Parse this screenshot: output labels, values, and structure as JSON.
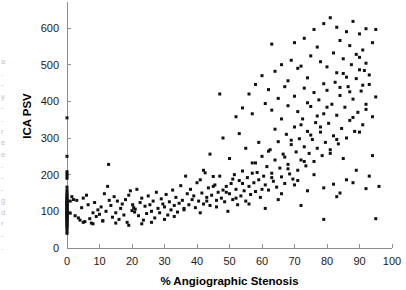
{
  "figure": {
    "kind": "scatter-plot",
    "background_color": "#ffffff",
    "point_color": "#111111",
    "axis_color": "#8d8d8d",
    "edge_marginalia": "a\n.\n-\ny\n-\n.\nr\ne\ne\n.\n-\n-\ng\nd\nr\n-\n."
  },
  "chart_data": {
    "type": "scatter",
    "title": "",
    "xlabel": "% Angiographic Stenosis",
    "ylabel": "ICA PSV",
    "xlim": [
      0,
      100
    ],
    "ylim": [
      0,
      650
    ],
    "xticks": [
      0,
      10,
      20,
      30,
      40,
      50,
      60,
      70,
      80,
      90,
      100
    ],
    "yticks": [
      0,
      100,
      200,
      300,
      400,
      500,
      600
    ],
    "xticklabels": [
      "0",
      "10",
      "20",
      "30",
      "40",
      "50",
      "60",
      "70",
      "80",
      "90",
      "100"
    ],
    "yticklabels": [
      "0",
      "100",
      "200",
      "300",
      "400",
      "500",
      "600"
    ],
    "grid": false,
    "legend": null,
    "marker": "filled-square",
    "marker_size_px": 3,
    "n_points": 286,
    "points": [
      [
        0,
        40
      ],
      [
        0,
        46
      ],
      [
        0,
        52
      ],
      [
        0,
        57
      ],
      [
        0,
        60
      ],
      [
        0,
        63
      ],
      [
        0,
        66
      ],
      [
        0,
        69
      ],
      [
        0,
        72
      ],
      [
        0,
        75
      ],
      [
        0,
        78
      ],
      [
        0,
        80
      ],
      [
        0,
        82
      ],
      [
        0,
        84
      ],
      [
        0,
        86
      ],
      [
        0,
        88
      ],
      [
        0,
        90
      ],
      [
        0,
        92
      ],
      [
        0,
        94
      ],
      [
        0,
        96
      ],
      [
        0,
        98
      ],
      [
        0,
        100
      ],
      [
        0,
        102
      ],
      [
        0,
        104
      ],
      [
        0,
        106
      ],
      [
        0,
        108
      ],
      [
        0,
        110
      ],
      [
        0,
        112
      ],
      [
        0,
        114
      ],
      [
        0,
        116
      ],
      [
        0,
        118
      ],
      [
        0,
        120
      ],
      [
        0,
        122
      ],
      [
        0,
        124
      ],
      [
        0,
        126
      ],
      [
        0,
        128
      ],
      [
        0,
        130
      ],
      [
        0,
        133
      ],
      [
        0,
        136
      ],
      [
        0,
        139
      ],
      [
        0,
        143
      ],
      [
        0,
        147
      ],
      [
        0,
        152
      ],
      [
        0,
        158
      ],
      [
        0,
        166
      ],
      [
        0,
        190
      ],
      [
        0,
        196
      ],
      [
        0,
        202
      ],
      [
        0,
        208
      ],
      [
        0,
        250
      ],
      [
        0,
        355
      ],
      [
        1,
        95
      ],
      [
        1,
        128
      ],
      [
        1.5,
        140
      ],
      [
        2,
        132
      ],
      [
        2.5,
        88
      ],
      [
        3,
        130
      ],
      [
        3.5,
        82
      ],
      [
        4,
        76
      ],
      [
        4.5,
        110
      ],
      [
        5,
        136
      ],
      [
        5.5,
        72
      ],
      [
        6,
        144
      ],
      [
        6.5,
        118
      ],
      [
        7,
        80
      ],
      [
        7.5,
        68
      ],
      [
        8,
        96
      ],
      [
        8.5,
        124
      ],
      [
        9,
        86
      ],
      [
        9.5,
        104
      ],
      [
        10,
        92
      ],
      [
        10.5,
        112
      ],
      [
        11,
        74
      ],
      [
        11.5,
        148
      ],
      [
        12,
        100
      ],
      [
        12.5,
        168
      ],
      [
        12.8,
        228
      ],
      [
        13,
        130
      ],
      [
        13.5,
        116
      ],
      [
        14,
        84
      ],
      [
        14.5,
        140
      ],
      [
        15,
        96
      ],
      [
        15.5,
        128
      ],
      [
        16,
        78
      ],
      [
        16.5,
        108
      ],
      [
        17,
        120
      ],
      [
        17.5,
        90
      ],
      [
        18,
        132
      ],
      [
        18.5,
        70
      ],
      [
        19,
        144
      ],
      [
        19.5,
        156
      ],
      [
        20,
        102
      ],
      [
        20.2,
        118
      ],
      [
        20.5,
        110
      ],
      [
        20.8,
        98
      ],
      [
        21,
        106
      ],
      [
        21.5,
        160
      ],
      [
        22,
        88
      ],
      [
        22.5,
        124
      ],
      [
        23,
        136
      ],
      [
        23.5,
        76
      ],
      [
        24,
        114
      ],
      [
        24.5,
        94
      ],
      [
        25,
        142
      ],
      [
        25.5,
        118
      ],
      [
        26,
        100
      ],
      [
        26.5,
        128
      ],
      [
        27,
        82
      ],
      [
        27.5,
        152
      ],
      [
        28,
        108
      ],
      [
        28.5,
        96
      ],
      [
        29,
        134
      ],
      [
        29.5,
        120
      ],
      [
        30,
        112
      ],
      [
        30.5,
        146
      ],
      [
        31,
        90
      ],
      [
        31.5,
        126
      ],
      [
        32,
        104
      ],
      [
        32.5,
        158
      ],
      [
        33,
        116
      ],
      [
        33.5,
        138
      ],
      [
        34,
        98
      ],
      [
        34.5,
        122
      ],
      [
        35,
        170
      ],
      [
        35.5,
        130
      ],
      [
        36,
        108
      ],
      [
        36.5,
        196
      ],
      [
        37,
        148
      ],
      [
        37.5,
        118
      ],
      [
        38,
        160
      ],
      [
        38.5,
        132
      ],
      [
        39,
        142
      ],
      [
        39.5,
        110
      ],
      [
        40,
        178
      ],
      [
        40.5,
        128
      ],
      [
        41,
        186
      ],
      [
        41.5,
        150
      ],
      [
        42,
        120
      ],
      [
        42.5,
        205
      ],
      [
        43,
        138
      ],
      [
        43.5,
        164
      ],
      [
        44,
        116
      ],
      [
        44.5,
        144
      ],
      [
        45,
        195
      ],
      [
        45.5,
        172
      ],
      [
        46,
        130
      ],
      [
        46.5,
        152
      ],
      [
        47,
        420
      ],
      [
        47.5,
        136
      ],
      [
        48,
        158
      ],
      [
        48.5,
        126
      ],
      [
        49,
        168
      ],
      [
        49.5,
        100
      ],
      [
        50,
        148
      ],
      [
        50.5,
        176
      ],
      [
        51,
        132
      ],
      [
        51.5,
        200
      ],
      [
        52,
        160
      ],
      [
        52.5,
        118
      ],
      [
        53,
        184
      ],
      [
        53.5,
        142
      ],
      [
        54,
        210
      ],
      [
        54.5,
        156
      ],
      [
        55,
        128
      ],
      [
        55.5,
        192
      ],
      [
        56,
        168
      ],
      [
        56.5,
        146
      ],
      [
        57,
        232
      ],
      [
        57.5,
        178
      ],
      [
        58,
        154
      ],
      [
        58.5,
        206
      ],
      [
        59,
        186
      ],
      [
        59.5,
        138
      ],
      [
        60,
        250
      ],
      [
        60.5,
        196
      ],
      [
        61,
        172
      ],
      [
        61.5,
        222
      ],
      [
        62,
        158
      ],
      [
        62.5,
        268
      ],
      [
        63,
        204
      ],
      [
        63.5,
        182
      ],
      [
        64,
        240
      ],
      [
        64.5,
        166
      ],
      [
        65,
        290
      ],
      [
        65.5,
        218
      ],
      [
        66,
        194
      ],
      [
        66.5,
        256
      ],
      [
        67,
        176
      ],
      [
        67.5,
        310
      ],
      [
        68,
        228
      ],
      [
        68.5,
        202
      ],
      [
        69,
        282
      ],
      [
        69.5,
        188
      ],
      [
        70,
        330
      ],
      [
        70.5,
        262
      ],
      [
        71,
        212
      ],
      [
        71.5,
        298
      ],
      [
        72,
        240
      ],
      [
        72.5,
        352
      ],
      [
        73,
        276
      ],
      [
        73.5,
        224
      ],
      [
        74,
        318
      ],
      [
        74.5,
        258
      ],
      [
        75,
        386
      ],
      [
        75.5,
        296
      ],
      [
        76,
        236
      ],
      [
        76.5,
        342
      ],
      [
        77,
        272
      ],
      [
        77.5,
        404
      ],
      [
        78,
        316
      ],
      [
        78.5,
        252
      ],
      [
        79,
        366
      ],
      [
        79.5,
        288
      ],
      [
        80,
        430
      ],
      [
        80.5,
        340
      ],
      [
        81,
        268
      ],
      [
        81.5,
        392
      ],
      [
        82,
        306
      ],
      [
        82.5,
        452
      ],
      [
        83,
        362
      ],
      [
        83.5,
        284
      ],
      [
        84,
        416
      ],
      [
        84.5,
        326
      ],
      [
        85,
        476
      ],
      [
        85.5,
        384
      ],
      [
        86,
        300
      ],
      [
        86.5,
        440
      ],
      [
        87,
        348
      ],
      [
        87.5,
        500
      ],
      [
        88,
        406
      ],
      [
        88.5,
        318
      ],
      [
        89,
        462
      ],
      [
        89.5,
        370
      ],
      [
        90,
        520
      ],
      [
        90.5,
        428
      ],
      [
        91,
        336
      ],
      [
        91.5,
        484
      ],
      [
        92,
        392
      ],
      [
        93,
        446
      ],
      [
        94,
        358
      ],
      [
        76,
        596
      ],
      [
        79,
        612
      ],
      [
        81,
        628
      ],
      [
        83,
        602
      ],
      [
        86,
        590
      ],
      [
        88,
        618
      ],
      [
        90,
        584
      ],
      [
        92,
        598
      ],
      [
        95,
        596
      ],
      [
        70,
        560
      ],
      [
        73,
        572
      ],
      [
        77,
        548
      ],
      [
        84,
        566
      ],
      [
        87,
        552
      ],
      [
        91,
        540
      ],
      [
        94,
        560
      ],
      [
        63,
        556
      ],
      [
        66,
        500
      ],
      [
        69,
        512
      ],
      [
        72,
        496
      ],
      [
        75,
        524
      ],
      [
        78,
        508
      ],
      [
        82,
        532
      ],
      [
        85,
        516
      ],
      [
        89,
        528
      ],
      [
        92,
        504
      ],
      [
        60,
        470
      ],
      [
        64,
        482
      ],
      [
        68,
        456
      ],
      [
        71,
        490
      ],
      [
        74,
        464
      ],
      [
        80,
        494
      ],
      [
        83,
        478
      ],
      [
        86,
        466
      ],
      [
        90,
        486
      ],
      [
        93,
        472
      ],
      [
        56,
        420
      ],
      [
        58,
        446
      ],
      [
        62,
        432
      ],
      [
        65,
        408
      ],
      [
        67,
        440
      ],
      [
        70,
        414
      ],
      [
        73,
        436
      ],
      [
        76,
        424
      ],
      [
        79,
        448
      ],
      [
        84,
        438
      ],
      [
        87,
        426
      ],
      [
        91,
        444
      ],
      [
        95,
        412
      ],
      [
        52,
        358
      ],
      [
        54,
        382
      ],
      [
        57,
        366
      ],
      [
        61,
        394
      ],
      [
        63,
        376
      ],
      [
        66,
        352
      ],
      [
        68,
        388
      ],
      [
        71,
        372
      ],
      [
        74,
        396
      ],
      [
        77,
        360
      ],
      [
        80,
        384
      ],
      [
        88,
        356
      ],
      [
        92,
        378
      ],
      [
        48,
        300
      ],
      [
        53,
        312
      ],
      [
        59,
        288
      ],
      [
        64,
        324
      ],
      [
        69,
        294
      ],
      [
        72,
        336
      ],
      [
        75,
        308
      ],
      [
        78,
        330
      ],
      [
        83,
        296
      ],
      [
        90,
        316
      ],
      [
        44,
        256
      ],
      [
        50,
        244
      ],
      [
        55,
        272
      ],
      [
        58,
        232
      ],
      [
        62,
        264
      ],
      [
        67,
        248
      ],
      [
        73,
        236
      ],
      [
        81,
        258
      ],
      [
        85,
        244
      ],
      [
        94,
        252
      ],
      [
        42,
        212
      ],
      [
        47,
        196
      ],
      [
        51,
        188
      ],
      [
        57,
        204
      ],
      [
        63,
        192
      ],
      [
        68,
        216
      ],
      [
        71,
        184
      ],
      [
        76,
        200
      ],
      [
        82,
        174
      ],
      [
        86,
        186
      ],
      [
        89,
        212
      ],
      [
        93,
        196
      ],
      [
        45,
        168
      ],
      [
        49,
        152
      ],
      [
        54,
        176
      ],
      [
        60,
        160
      ],
      [
        66,
        148
      ],
      [
        70,
        172
      ],
      [
        74,
        156
      ],
      [
        79,
        164
      ],
      [
        84,
        150
      ],
      [
        88,
        178
      ],
      [
        92,
        162
      ],
      [
        96,
        168
      ],
      [
        43,
        128
      ],
      [
        46,
        112
      ],
      [
        52,
        136
      ],
      [
        56,
        120
      ],
      [
        61,
        108
      ],
      [
        65,
        132
      ],
      [
        72,
        116
      ],
      [
        83,
        140
      ],
      [
        95,
        80
      ],
      [
        79,
        78
      ],
      [
        41,
        96
      ],
      [
        36,
        104
      ],
      [
        33,
        86
      ],
      [
        30,
        78
      ],
      [
        26,
        70
      ],
      [
        23,
        66
      ],
      [
        19,
        62
      ],
      [
        15,
        68
      ],
      [
        11,
        74
      ],
      [
        8,
        66
      ],
      [
        5,
        70
      ]
    ]
  }
}
